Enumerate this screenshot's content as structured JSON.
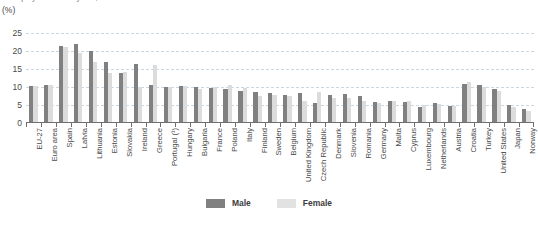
{
  "header": {
    "title": "Unemployment rate by sex, 2012",
    "unit_label": "(%)"
  },
  "legend": {
    "position": "bottom-center",
    "items": [
      {
        "label": "Male",
        "color": "#808080",
        "icon": "square-swatch-icon"
      },
      {
        "label": "Female",
        "color": "#e2e2e2",
        "icon": "square-swatch-icon"
      }
    ]
  },
  "chart_data": {
    "type": "bar",
    "title": "Unemployment rate by sex, 2012",
    "xlabel": "",
    "ylabel": "(%)",
    "ylim": [
      0,
      25
    ],
    "yticks": [
      0,
      5,
      10,
      15,
      20,
      25
    ],
    "grid": true,
    "categories": [
      "EU-27",
      "Euro area",
      "Spain",
      "Latvia",
      "Lithuania",
      "Estonia",
      "Slovakia",
      "Ireland",
      "Greece",
      "Portugal (¹)",
      "Hungary",
      "Bulgaria",
      "France",
      "Poland",
      "Italy",
      "Finland",
      "Sweden",
      "Belgium",
      "United Kingdom",
      "Czech Republic",
      "Denmark",
      "Slovenia",
      "Romania",
      "Germany",
      "Malta",
      "Cyprus",
      "Luxembourg",
      "Netherlands",
      "Austria",
      "Croatia",
      "Turkey",
      "United States",
      "Japan",
      "Norway"
    ],
    "series": [
      {
        "name": "Male",
        "color": "#808080",
        "values": [
          10.4,
          10.6,
          21.5,
          22.0,
          20.0,
          17.0,
          14.0,
          16.5,
          10.5,
          10.0,
          10.3,
          10.0,
          9.8,
          9.5,
          9.0,
          8.5,
          8.2,
          7.8,
          8.3,
          5.5,
          7.8,
          8.0,
          7.5,
          5.9,
          6.0,
          5.8,
          4.5,
          5.5,
          4.8,
          10.8,
          10.5,
          9.5,
          5.0,
          3.8
        ],
        "unit": "%"
      },
      {
        "name": "Female",
        "color": "#dcdcdc",
        "values": [
          10.4,
          10.6,
          21.0,
          19.5,
          17.0,
          14.0,
          14.3,
          10.0,
          16.0,
          10.0,
          10.2,
          9.5,
          10.0,
          10.5,
          9.8,
          7.5,
          7.8,
          7.5,
          6.0,
          8.5,
          7.0,
          7.0,
          6.2,
          5.5,
          6.2,
          6.0,
          5.0,
          5.3,
          4.8,
          11.5,
          10.0,
          9.0,
          4.5,
          3.2
        ],
        "unit": "%"
      }
    ]
  }
}
